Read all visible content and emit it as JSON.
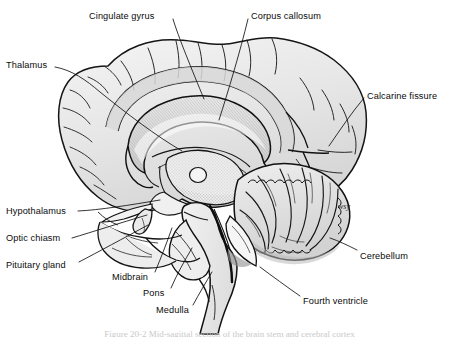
{
  "figure": {
    "title": "Sagittal section of the brain",
    "type": "anatomical-illustration",
    "style": "grayscale line drawing with stippling and hatching",
    "colors": {
      "background": "#ffffff",
      "outline": "#1a1a1a",
      "cortex_fill": "#e4e4e4",
      "cortex_fill_light": "#f1f1f1",
      "corpus_callosum_fill": "#d9d9d9",
      "brainstem_fill": "#ececec",
      "cerebellum_fill": "#e0e0e0",
      "leader_line": "#111111",
      "label_text": "#0b0b0b"
    }
  },
  "labels": [
    {
      "id": "cingulate-gyrus",
      "text": "Cingulate gyrus",
      "x": 89,
      "y": 11,
      "anchor": "start",
      "leader": [
        [
          173,
          19
        ],
        [
          204,
          99
        ]
      ]
    },
    {
      "id": "corpus-callosum",
      "text": "Corpus callosum",
      "x": 251,
      "y": 11,
      "anchor": "start",
      "leader": [
        [
          248,
          19
        ],
        [
          219,
          120
        ]
      ]
    },
    {
      "id": "thalamus",
      "text": "Thalamus",
      "x": 6,
      "y": 60,
      "anchor": "start",
      "leader": [
        [
          55,
          67
        ],
        [
          182,
          151
        ]
      ]
    },
    {
      "id": "calcarine-fissure",
      "text": "Calcarine fissure",
      "x": 367,
      "y": 91,
      "anchor": "start",
      "leader": [
        [
          364,
          98
        ],
        [
          329,
          146
        ]
      ]
    },
    {
      "id": "hypothalamus",
      "text": "Hypothalamus",
      "x": 6,
      "y": 206,
      "anchor": "start",
      "leader": [
        [
          78,
          211
        ],
        [
          160,
          200
        ]
      ]
    },
    {
      "id": "optic-chiasm",
      "text": "Optic chiasm",
      "x": 6,
      "y": 233,
      "anchor": "start",
      "leader": [
        [
          72,
          238
        ],
        [
          147,
          215
        ]
      ]
    },
    {
      "id": "pituitary-gland",
      "text": "Pituitary gland",
      "x": 6,
      "y": 260,
      "anchor": "start",
      "leader": [
        [
          79,
          262
        ],
        [
          148,
          225
        ]
      ]
    },
    {
      "id": "midbrain",
      "text": "Midbrain",
      "x": 112,
      "y": 272,
      "anchor": "start",
      "leader": [
        [
          155,
          272
        ],
        [
          172,
          228
        ]
      ]
    },
    {
      "id": "pons",
      "text": "Pons",
      "x": 143,
      "y": 288,
      "anchor": "start",
      "leader": [
        [
          171,
          288
        ],
        [
          192,
          248
        ]
      ]
    },
    {
      "id": "medulla",
      "text": "Medulla",
      "x": 156,
      "y": 305,
      "anchor": "start",
      "leader": [
        [
          193,
          305
        ],
        [
          212,
          272
        ]
      ]
    },
    {
      "id": "fourth-ventricle",
      "text": "Fourth ventricle",
      "x": 303,
      "y": 296,
      "anchor": "start",
      "leader": [
        [
          300,
          296
        ],
        [
          260,
          267
        ]
      ]
    },
    {
      "id": "cerebellum",
      "text": "Cerebellum",
      "x": 360,
      "y": 251,
      "anchor": "start",
      "leader": [
        [
          357,
          250
        ],
        [
          330,
          238
        ]
      ]
    }
  ],
  "signature": {
    "id": "artist-signature",
    "text": "wsy",
    "x": 338,
    "y": 207
  },
  "caption": {
    "text": "Figure 20-2 Mid-sagittal section of the brain stem and cerebral cortex",
    "visible": "clipped at the bottom edge of the image"
  }
}
